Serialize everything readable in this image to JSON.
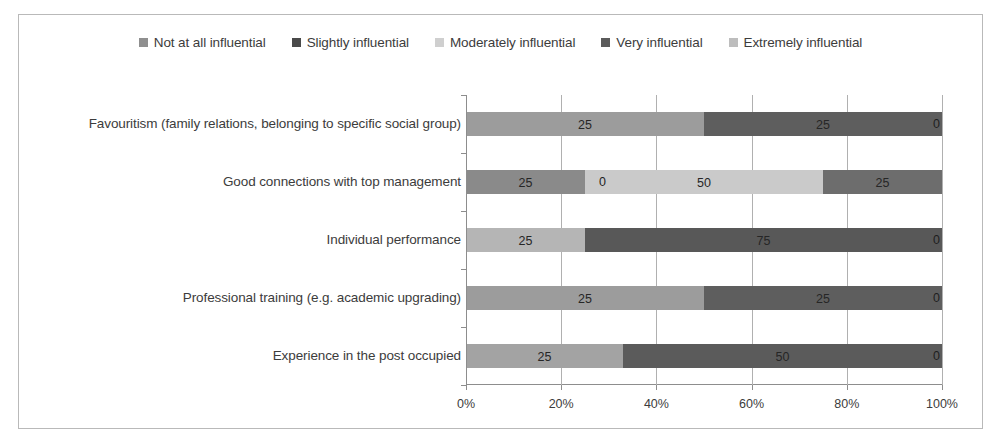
{
  "chart_data": {
    "type": "bar",
    "subtype": "stacked-horizontal-100-percent",
    "title": "",
    "xlabel": "",
    "ylabel": "",
    "xlim": [
      0,
      100
    ],
    "xticks": [
      "0%",
      "20%",
      "40%",
      "60%",
      "80%",
      "100%"
    ],
    "xtick_values": [
      0,
      20,
      40,
      60,
      80,
      100
    ],
    "grid": "vertical",
    "legend_position": "top-center",
    "categories": [
      "Favouritism (family relations, belonging to specific social group)",
      "Good connections with top management",
      "Individual performance",
      "Professional training (e.g. academic upgrading)",
      "Experience in the post occupied"
    ],
    "series": [
      {
        "name": "Not at all influential",
        "color": "#8f8f8f",
        "values": [
          0,
          0,
          0,
          0,
          0
        ]
      },
      {
        "name": "Slightly influential",
        "color": "#4a4a4a",
        "values": [
          0,
          25,
          0,
          0,
          0
        ]
      },
      {
        "name": "Moderately influential",
        "color": "#c9c9c9",
        "values": [
          50,
          50,
          25,
          50,
          33
        ]
      },
      {
        "name": "Very influential",
        "color": "#5b5b5b",
        "values": [
          50,
          25,
          75,
          50,
          67
        ]
      },
      {
        "name": "Extremely influential",
        "color": "#bdbdbd",
        "values": [
          0,
          0,
          0,
          0,
          0
        ]
      }
    ],
    "bars": [
      {
        "category": "Favouritism (family relations, belonging to specific social group)",
        "segments": [
          {
            "series": "Moderately influential",
            "start": 0,
            "end": 50,
            "label": "25",
            "color": "#9c9c9c"
          },
          {
            "series": "Very influential",
            "start": 50,
            "end": 100,
            "label": "25",
            "color": "#5e5e5e"
          }
        ],
        "end_label": "0"
      },
      {
        "category": "Good connections with top management",
        "segments": [
          {
            "series": "Not at all influential",
            "start": 0,
            "end": 25,
            "label": "25",
            "color": "#8a8a8a"
          },
          {
            "series": "Moderately influential",
            "start": 25,
            "end": 75,
            "label": "50",
            "color": "#cacaca"
          },
          {
            "series": "Very influential",
            "start": 75,
            "end": 100,
            "label": "25",
            "color": "#6d6d6d"
          }
        ],
        "inline_zero_label": "0",
        "inline_zero_at": 25,
        "end_label": ""
      },
      {
        "category": "Individual performance",
        "segments": [
          {
            "series": "Moderately influential",
            "start": 0,
            "end": 25,
            "label": "25",
            "color": "#b5b5b5"
          },
          {
            "series": "Very influential",
            "start": 25,
            "end": 100,
            "label": "75",
            "color": "#585858"
          }
        ],
        "end_label": "0"
      },
      {
        "category": "Professional training (e.g. academic upgrading)",
        "segments": [
          {
            "series": "Moderately influential",
            "start": 0,
            "end": 50,
            "label": "25",
            "color": "#9c9c9c"
          },
          {
            "series": "Very influential",
            "start": 50,
            "end": 100,
            "label": "25",
            "color": "#5e5e5e"
          }
        ],
        "end_label": "0"
      },
      {
        "category": "Experience in the post occupied",
        "segments": [
          {
            "series": "Moderately influential",
            "start": 0,
            "end": 33,
            "label": "25",
            "color": "#a3a3a3"
          },
          {
            "series": "Very influential",
            "start": 33,
            "end": 100,
            "label": "50",
            "color": "#5b5b5b"
          }
        ],
        "end_label": "0"
      }
    ],
    "legend": [
      {
        "label": "Not at all influential",
        "color": "#8f8f8f"
      },
      {
        "label": "Slightly influential",
        "color": "#4a4a4a"
      },
      {
        "label": "Moderately influential",
        "color": "#cfcfcf"
      },
      {
        "label": "Very influential",
        "color": "#5b5b5b"
      },
      {
        "label": "Extremely influential",
        "color": "#bdbdbd"
      }
    ]
  }
}
